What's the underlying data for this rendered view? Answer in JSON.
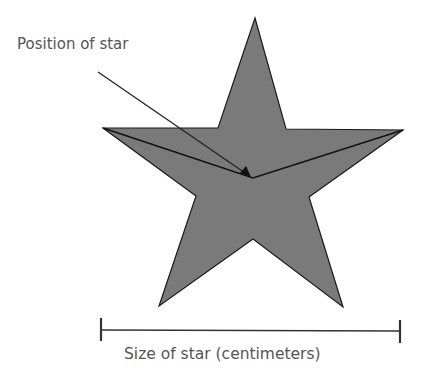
{
  "diagram": {
    "annotation_label": "Position of star",
    "ruler_label": "Size of star (centimeters)",
    "colors": {
      "star_fill": "#7a7a7a",
      "outline": "#1a1a1a",
      "text": "#555555"
    }
  }
}
